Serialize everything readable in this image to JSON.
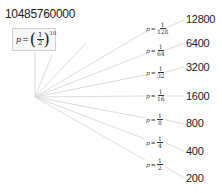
{
  "root": {
    "value": "10485760000",
    "label": {
      "var": "p",
      "eq": "=",
      "num": "1",
      "den": "2",
      "exp": "10"
    }
  },
  "branches": [
    {
      "label": {
        "var": "p",
        "eq": "=",
        "num": "1",
        "den": "128"
      },
      "value": "12800"
    },
    {
      "label": {
        "var": "p",
        "eq": "=",
        "num": "1",
        "den": "64"
      },
      "value": "6400"
    },
    {
      "label": {
        "var": "p",
        "eq": "=",
        "num": "1",
        "den": "32"
      },
      "value": "3200"
    },
    {
      "label": {
        "var": "p",
        "eq": "=",
        "num": "1",
        "den": "16"
      },
      "value": "1600"
    },
    {
      "label": {
        "var": "p",
        "eq": "=",
        "num": "1",
        "den": "8"
      },
      "value": "800"
    },
    {
      "label": {
        "var": "p",
        "eq": "=",
        "num": "1",
        "den": "4"
      },
      "value": "400"
    },
    {
      "label": {
        "var": "p",
        "eq": "=",
        "num": "1",
        "den": "2"
      },
      "value": "200"
    }
  ],
  "colors": {
    "line": "#d9d9d9",
    "box_border": "#cfcfcf",
    "box_fill": "#f7f7f7",
    "text": "#222222"
  }
}
